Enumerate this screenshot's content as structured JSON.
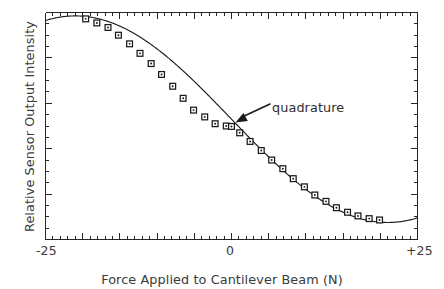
{
  "chart_data": {
    "type": "line",
    "title": "",
    "xlabel": "Force Applied to Cantilever Beam (N)",
    "ylabel": "Relative Sensor Output Intensity",
    "xlim": [
      -25,
      25
    ],
    "ylim": [
      0,
      1
    ],
    "grid": false,
    "legend": null,
    "xtick_labels": [
      "-25",
      "0",
      "+25"
    ],
    "xtick_values": [
      -25,
      0,
      25
    ],
    "ytick_labels": [],
    "annotations": [
      {
        "text": "quadrature",
        "target_x": 0.0,
        "target_y": 0.5,
        "label_x": 7.5,
        "label_y": 0.62
      }
    ],
    "series": [
      {
        "name": "Sensor response",
        "marker": "open-square-with-dot",
        "line": "solid",
        "x": [
          -19.6,
          -18.1,
          -16.6,
          -15.2,
          -13.7,
          -12.3,
          -10.8,
          -9.4,
          -7.9,
          -6.5,
          -5.1,
          -3.6,
          -2.2,
          -0.7,
          0.0,
          1.1,
          2.5,
          4.0,
          5.4,
          6.9,
          8.3,
          9.8,
          11.2,
          12.7,
          14.1,
          15.6,
          17.0,
          18.5,
          19.9
        ],
        "y": [
          0.972,
          0.954,
          0.934,
          0.9,
          0.862,
          0.82,
          0.775,
          0.727,
          0.675,
          0.622,
          0.57,
          0.54,
          0.51,
          0.5,
          0.498,
          0.47,
          0.432,
          0.392,
          0.35,
          0.312,
          0.268,
          0.232,
          0.196,
          0.168,
          0.14,
          0.12,
          0.104,
          0.092,
          0.086
        ]
      }
    ]
  },
  "axes": {
    "frame_color": "#262626",
    "curve_color": "#1c1c1c",
    "marker_face": "#ffffff",
    "marker_edge": "#1a1a1a"
  }
}
